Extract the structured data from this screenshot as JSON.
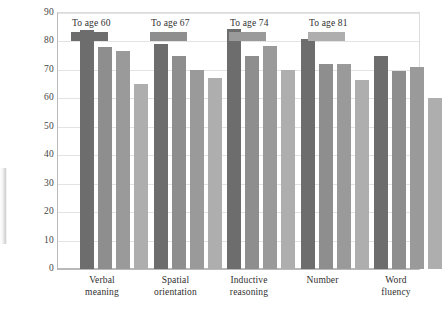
{
  "figure": {
    "background": "#ffffff",
    "frame_color": "#dcdcdc",
    "gridline_color": "#e3e3e3"
  },
  "legend": {
    "items": [
      {
        "label": "To age 60",
        "color": "#6d6d6d"
      },
      {
        "label": "To age 67",
        "color": "#8e8e8e"
      },
      {
        "label": "To age 74",
        "color": "#9a9a9a"
      },
      {
        "label": "To age 81",
        "color": "#aeaeae"
      }
    ]
  },
  "y_axis": {
    "title": "Percentage maintaining over 7 years",
    "ticks": [
      "0",
      "10",
      "20",
      "30",
      "40",
      "50",
      "60",
      "70",
      "80",
      "90"
    ]
  },
  "x_axis": {
    "categories": [
      {
        "line1": "Verbal",
        "line2": "meaning"
      },
      {
        "line1": "Spatial",
        "line2": "orientation"
      },
      {
        "line1": "Inductive",
        "line2": "reasoning"
      },
      {
        "line1": "Number",
        "line2": ""
      },
      {
        "line1": "Word",
        "line2": "fluency"
      }
    ]
  },
  "chart_data": {
    "type": "bar",
    "title": "",
    "xlabel": "",
    "ylabel": "Percentage maintaining over 7 years",
    "ylim": [
      0,
      90
    ],
    "yticks": [
      0,
      10,
      20,
      30,
      40,
      50,
      60,
      70,
      80,
      90
    ],
    "grid": true,
    "legend_position": "inside top-left",
    "categories": [
      "Verbal meaning",
      "Spatial orientation",
      "Inductive reasoning",
      "Number",
      "Word fluency"
    ],
    "series": [
      {
        "name": "To age 60",
        "color": "#6d6d6d",
        "values": [
          84,
          79,
          84.5,
          81,
          75
        ]
      },
      {
        "name": "To age 67",
        "color": "#8e8e8e",
        "values": [
          78,
          75,
          75,
          72,
          69.5
        ]
      },
      {
        "name": "To age 74",
        "color": "#9a9a9a",
        "values": [
          76.5,
          70,
          78.5,
          72,
          71
        ]
      },
      {
        "name": "To age 81",
        "color": "#aeaeae",
        "values": [
          65,
          67,
          70,
          66.5,
          60
        ]
      }
    ]
  }
}
